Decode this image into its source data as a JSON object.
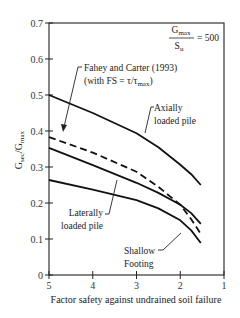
{
  "chart_data": {
    "type": "line",
    "title": "",
    "xlabel": "Factor safety against undrained soil failure",
    "ylabel": "G_sec/G_max",
    "ylabel_main": "G",
    "ylabel_sub1": "sec",
    "ylabel_mid": "/G",
    "ylabel_sub2": "max",
    "xlim": [
      5,
      1
    ],
    "ylim": [
      0,
      0.7
    ],
    "x_reversed": true,
    "grid": false,
    "xticks": [
      5,
      4,
      3,
      2,
      1
    ],
    "xtick_labels": [
      "5",
      "4",
      "3",
      "2",
      "1"
    ],
    "yticks": [
      0,
      0.1,
      0.2,
      0.3,
      0.4,
      0.5,
      0.6,
      0.7
    ],
    "ytick_labels": [
      "0",
      "0.1",
      "0.2",
      "0.3",
      "0.4",
      "0.5",
      "0.6",
      "0.7"
    ],
    "annotation_ratio": {
      "numerator_main": "G",
      "numerator_sub": "max",
      "denominator_main": "S",
      "denominator_sub": "u",
      "value": "= 500"
    },
    "series": [
      {
        "name": "Axially loaded pile",
        "style": "solid",
        "x": [
          5,
          4,
          3,
          2.5,
          2,
          1.75,
          1.53
        ],
        "y": [
          0.5,
          0.45,
          0.394,
          0.355,
          0.306,
          0.28,
          0.25
        ]
      },
      {
        "name": "Fahey and Carter (1993) (with FS = τ/τmax)",
        "style": "dashed",
        "x": [
          5,
          4,
          3,
          2.5,
          2,
          1.75,
          1.53
        ],
        "y": [
          0.383,
          0.34,
          0.287,
          0.245,
          0.195,
          0.155,
          0.114
        ]
      },
      {
        "name": "Laterally loaded pile",
        "style": "solid",
        "x": [
          5,
          4,
          3,
          2.5,
          2,
          1.75,
          1.53
        ],
        "y": [
          0.353,
          0.305,
          0.256,
          0.228,
          0.195,
          0.172,
          0.142
        ]
      },
      {
        "name": "Shallow Footing",
        "style": "solid",
        "x": [
          5,
          4,
          3,
          2.5,
          2,
          1.75,
          1.53
        ],
        "y": [
          0.264,
          0.237,
          0.208,
          0.185,
          0.152,
          0.124,
          0.089
        ]
      }
    ],
    "labels": {
      "fahey_line1": "Fahey and Carter (1993)",
      "fahey_line2_prefix": "(with FS = τ/τ",
      "fahey_line2_sub": "max",
      "fahey_line2_suffix": ")",
      "axial_line1": "Axially",
      "axial_line2": "loaded pile",
      "lateral_line1": "Laterally",
      "lateral_line2": "loaded pile",
      "shallow_line1": "Shallow",
      "shallow_line2": "Footing"
    }
  }
}
